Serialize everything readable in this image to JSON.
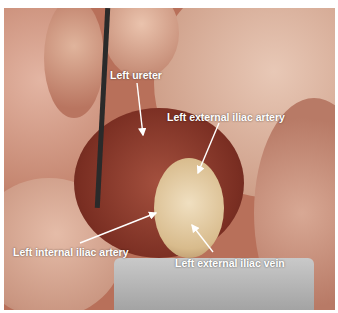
{
  "image": {
    "description": "Intraoperative photograph of left pelvic side wall dissection with labeled anatomy",
    "labels": [
      {
        "id": "left-ureter",
        "text": "Left ureter"
      },
      {
        "id": "left-external-iliac-artery",
        "text": "Left external iliac artery"
      },
      {
        "id": "left-internal-iliac-artery",
        "text": "Left internal iliac artery"
      },
      {
        "id": "left-external-iliac-vein",
        "text": "Left external iliac vein"
      }
    ]
  },
  "colors": {
    "label_text": "#ffffff",
    "arrow": "#ffffff",
    "tissue_pink": "#d9a58f",
    "tissue_red": "#8a3a2c",
    "tissue_yellow": "#e6d2a0"
  }
}
